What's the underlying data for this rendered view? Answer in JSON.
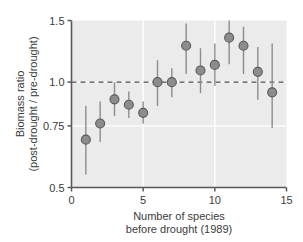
{
  "chart_data": {
    "type": "scatter",
    "title": "",
    "xlabel": "Number of species before drought (1989)",
    "xlabel_line1": "Number of species",
    "xlabel_line2": "before drought (1989)",
    "ylabel": "Biomass ratio (post-drought / pre-drought)",
    "ylabel_line1": "Biomass ratio",
    "ylabel_line2": "(post-drought / pre-drought)",
    "xlim": [
      0,
      15
    ],
    "ylim": [
      0.5,
      1.5
    ],
    "yscale": "log",
    "xticks": [
      0,
      5,
      10,
      15
    ],
    "xtick_labels": [
      "0",
      "5",
      "10",
      "15"
    ],
    "yticks": [
      0.5,
      0.75,
      1.0,
      1.5
    ],
    "ytick_labels": [
      "0.5",
      "0.75",
      "1.0",
      "1.5"
    ],
    "grid": true,
    "grid_color": "#ffffff",
    "panel_background": "#ebebeb",
    "legend": null,
    "reference_line": {
      "orientation": "horizontal",
      "value": 1.0,
      "style": "dashed",
      "color": "#4d4d4d"
    },
    "marker": {
      "shape": "circle",
      "fill": "#8c8c8c",
      "edge": "#595959",
      "size": 9
    },
    "errorbar": {
      "color": "#8c8c8c",
      "type": "vertical-range"
    },
    "x": [
      1,
      2,
      3,
      4,
      5,
      6,
      7,
      8,
      9,
      10,
      11,
      12,
      13,
      14
    ],
    "values": [
      0.685,
      0.762,
      0.893,
      0.862,
      0.817,
      1.0,
      1.0,
      1.27,
      1.08,
      1.12,
      1.34,
      1.27,
      1.07,
      0.935
    ],
    "errors_low": [
      0.545,
      0.675,
      0.8,
      0.79,
      0.76,
      0.855,
      0.905,
      1.055,
      0.93,
      0.975,
      1.125,
      1.055,
      0.89,
      0.74
    ],
    "errors_high": [
      0.855,
      0.88,
      1.0,
      0.94,
      0.88,
      1.155,
      1.095,
      1.47,
      1.25,
      1.29,
      1.5,
      1.44,
      1.26,
      1.29
    ],
    "series": [
      {
        "name": "biomass ratio",
        "points": [
          {
            "x": 1,
            "y": 0.685,
            "low": 0.545,
            "high": 0.855
          },
          {
            "x": 2,
            "y": 0.762,
            "low": 0.675,
            "high": 0.88
          },
          {
            "x": 3,
            "y": 0.893,
            "low": 0.8,
            "high": 1.0
          },
          {
            "x": 4,
            "y": 0.862,
            "low": 0.79,
            "high": 0.94
          },
          {
            "x": 5,
            "y": 0.817,
            "low": 0.76,
            "high": 0.88
          },
          {
            "x": 6,
            "y": 1.0,
            "low": 0.855,
            "high": 1.155
          },
          {
            "x": 7,
            "y": 1.0,
            "low": 0.905,
            "high": 1.095
          },
          {
            "x": 8,
            "y": 1.27,
            "low": 1.055,
            "high": 1.47
          },
          {
            "x": 9,
            "y": 1.08,
            "low": 0.93,
            "high": 1.25
          },
          {
            "x": 10,
            "y": 1.12,
            "low": 0.975,
            "high": 1.29
          },
          {
            "x": 11,
            "y": 1.34,
            "low": 1.125,
            "high": 1.5
          },
          {
            "x": 12,
            "y": 1.27,
            "low": 1.055,
            "high": 1.44
          },
          {
            "x": 13,
            "y": 1.07,
            "low": 0.89,
            "high": 1.26
          },
          {
            "x": 14,
            "y": 0.935,
            "low": 0.74,
            "high": 1.29
          }
        ]
      }
    ]
  }
}
